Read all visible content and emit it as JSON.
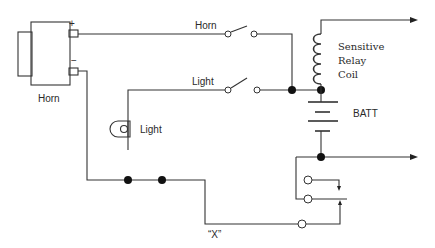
{
  "diagram": {
    "type": "electrical-schematic",
    "labels": {
      "horn_component": "Horn",
      "horn_plus": "+",
      "horn_minus": "−",
      "horn_switch": "Horn",
      "light_switch": "Light",
      "light_lamp": "Light",
      "relay_line1": "Sensitive",
      "relay_line2": "Relay",
      "relay_line3": "Coil",
      "battery": "BATT",
      "x_point": "“X”"
    },
    "components": [
      {
        "id": "horn",
        "kind": "horn",
        "label": "Horn"
      },
      {
        "id": "horn-switch",
        "kind": "spst-switch",
        "label": "Horn"
      },
      {
        "id": "light-switch",
        "kind": "spst-switch",
        "label": "Light"
      },
      {
        "id": "lamp",
        "kind": "lamp",
        "label": "Light"
      },
      {
        "id": "relay-coil",
        "kind": "inductor",
        "label": "Sensitive Relay Coil"
      },
      {
        "id": "battery",
        "kind": "battery",
        "label": "BATT"
      },
      {
        "id": "relay-contacts",
        "kind": "relay-contacts"
      },
      {
        "id": "point-x",
        "kind": "test-point",
        "label": "“X”"
      }
    ],
    "outputs": [
      "top-right-arrow",
      "middle-right-arrow"
    ]
  }
}
